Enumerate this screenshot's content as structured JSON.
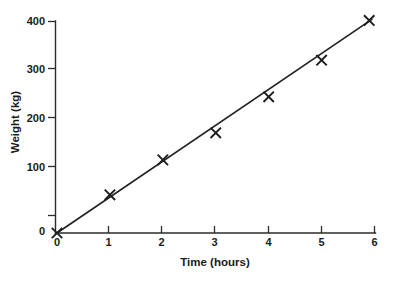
{
  "chart_data": {
    "type": "scatter",
    "title": "",
    "subtitle": "",
    "xlabel": "Time (hours)",
    "ylabel": "Weight (kg)",
    "xlim": [
      0,
      6
    ],
    "ylim": [
      0,
      400
    ],
    "xticks": [
      0,
      1,
      2,
      3,
      4,
      5,
      6
    ],
    "xtick_labels": [
      "0",
      "1",
      "2",
      "3",
      "4",
      "5",
      "6"
    ],
    "yticks": [
      0,
      100,
      200,
      300,
      400
    ],
    "ytick_labels": [
      "0",
      "100",
      "200",
      "300",
      "400"
    ],
    "grid": false,
    "legend": null,
    "marker": "x",
    "series": [
      {
        "name": "Weight",
        "marker": "x",
        "x": [
          0,
          1,
          2,
          3,
          4,
          5,
          5.9
        ],
        "values": [
          0,
          72,
          138,
          189,
          257,
          326,
          401
        ]
      }
    ],
    "trend_line": {
      "name": "line of best fit",
      "x": [
        0,
        5.95
      ],
      "values": [
        0,
        403
      ],
      "slope": 67.7,
      "intercept": 0
    },
    "annotations": []
  },
  "axes": {
    "y_axis_name": "weight-axis",
    "x_axis_name": "time-axis"
  }
}
